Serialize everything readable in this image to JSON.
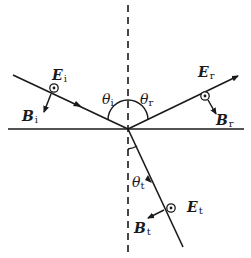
{
  "diagram": {
    "colors": {
      "stroke": "#1a1a1a",
      "background": "#ffffff"
    },
    "interface": {
      "label": ""
    },
    "normal": {
      "style": "dashed"
    },
    "incident": {
      "E_label": "E",
      "E_sub": "i",
      "B_label": "B",
      "B_sub": "i",
      "angle_label": "θ",
      "angle_sub": "i",
      "E_symbol": "dot-in-circle (out of page)"
    },
    "reflected": {
      "E_label": "E",
      "E_sub": "r",
      "B_label": "B",
      "B_sub": "r",
      "angle_label": "θ",
      "angle_sub": "r",
      "E_symbol": "dot-in-circle (out of page)"
    },
    "transmitted": {
      "E_label": "E",
      "E_sub": "t",
      "B_label": "B",
      "B_sub": "t",
      "angle_label": "θ",
      "angle_sub": "t",
      "E_symbol": "dot-in-circle (out of page)"
    }
  }
}
